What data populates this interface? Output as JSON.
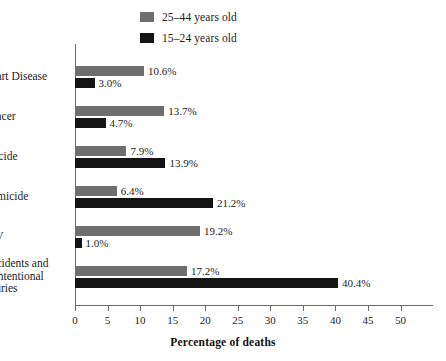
{
  "chart_data": {
    "type": "bar",
    "orientation": "horizontal",
    "title": "",
    "xlabel": "Percentage of deaths",
    "ylabel": "",
    "xlim": [
      0,
      55
    ],
    "xticks": [
      0,
      5,
      10,
      15,
      20,
      25,
      30,
      35,
      40,
      45,
      50
    ],
    "grid": false,
    "legend_position": "top",
    "categories": [
      "Heart Disease",
      "Cancer",
      "Suicide",
      "Homicide",
      "HIV",
      "Accidents and unintentional injuries"
    ],
    "series": [
      {
        "name": "25–44 years old",
        "color": "#6e6e6e",
        "values": [
          10.6,
          13.7,
          7.9,
          6.4,
          19.2,
          17.2
        ],
        "labels": [
          "10.6%",
          "13.7%",
          "7.9%",
          "6.4%",
          "19.2%",
          "17.2%"
        ]
      },
      {
        "name": "15–24 years old",
        "color": "#141414",
        "values": [
          3.0,
          4.7,
          13.9,
          21.2,
          1.0,
          40.4
        ],
        "labels": [
          "3.0%",
          "4.7%",
          "13.9%",
          "21.2%",
          "1.0%",
          "40.4%"
        ]
      }
    ]
  },
  "legend": {
    "items": [
      {
        "label": "25–44 years old",
        "color": "#6e6e6e"
      },
      {
        "label": "15–24 years old",
        "color": "#141414"
      }
    ]
  },
  "axis": {
    "x_title": "Percentage of deaths",
    "tick_labels": [
      "0",
      "5",
      "10",
      "15",
      "20",
      "25",
      "30",
      "35",
      "40",
      "45",
      "50"
    ]
  },
  "category_labels": [
    {
      "lines": [
        "Heart Disease"
      ]
    },
    {
      "lines": [
        "Cancer"
      ]
    },
    {
      "lines": [
        "Suicide"
      ]
    },
    {
      "lines": [
        "Homicide"
      ]
    },
    {
      "lines": [
        "HIV"
      ]
    },
    {
      "lines": [
        "Accidents and",
        "unintentional",
        "injuries"
      ]
    }
  ]
}
